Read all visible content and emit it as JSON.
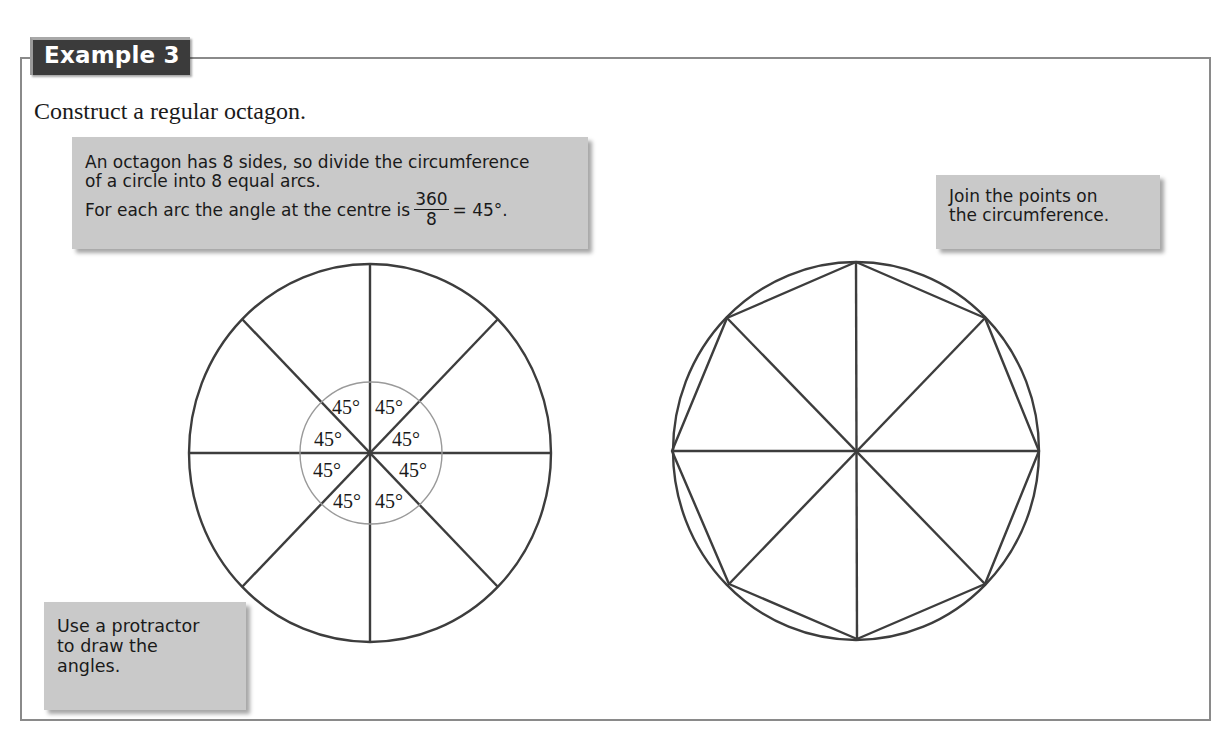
{
  "example": {
    "tab_label": "Example 3",
    "task": "Construct a regular octagon."
  },
  "callouts": {
    "divide": {
      "line1": "An octagon has 8 sides, so divide the circumference",
      "line2": "of a circle into 8 equal arcs.",
      "line3_prefix": "For each arc the angle at the centre is",
      "fraction_numerator": "360",
      "fraction_denominator": "8",
      "line3_suffix": "= 45°."
    },
    "join": {
      "line1": "Join the points on",
      "line2": "the circumference."
    },
    "protractor": {
      "line1": "Use a protractor",
      "line2": "to draw the",
      "line3": "angles."
    }
  },
  "diagram": {
    "left_figure": {
      "description": "Circle divided into 8 equal sectors by 4 diameters",
      "angle_labels": [
        "45°",
        "45°",
        "45°",
        "45°",
        "45°",
        "45°",
        "45°",
        "45°"
      ],
      "sector_angle_degrees": 45,
      "sectors": 8
    },
    "right_figure": {
      "description": "Regular octagon inscribed in circle with 8 radii",
      "sides": 8
    },
    "colors": {
      "stroke": "#3d3d3d",
      "protractor_arc": "#9a9a9a",
      "callout_fill": "#c9c9c9",
      "tab_fill": "#3b3b3b",
      "frame": "#8a8a8a"
    }
  }
}
